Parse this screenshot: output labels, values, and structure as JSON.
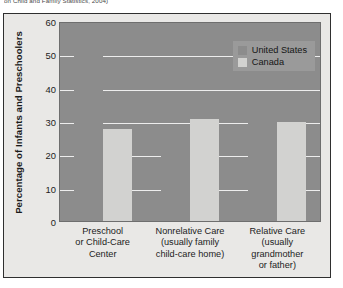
{
  "caption": "on Child and Family Statistics, 2004)",
  "chart_data": {
    "type": "bar",
    "title": "",
    "xlabel": "",
    "ylabel": "Percentage of Infants and Preschoolers",
    "ylim": [
      0,
      60
    ],
    "yticks": [
      0,
      10,
      20,
      30,
      40,
      50,
      60
    ],
    "grid": true,
    "legend_position": "top-right",
    "categories": [
      "Preschool or Child-Care Center",
      "Nonrelative Care (usually family child-care home)",
      "Relative Care (usually grandmother or father)"
    ],
    "category_lines": [
      [
        "Preschool",
        "or Child-Care",
        "Center"
      ],
      [
        "Nonrelative Care",
        "(usually family",
        "child-care home)"
      ],
      [
        "Relative Care",
        "(usually",
        "grandmother",
        "or father)"
      ]
    ],
    "series": [
      {
        "name": "United States",
        "color": "#8c8c8c",
        "values": [
          60,
          25,
          30
        ]
      },
      {
        "name": "Canada",
        "color": "#d2d2d0",
        "values": [
          28,
          31,
          30
        ]
      }
    ]
  }
}
